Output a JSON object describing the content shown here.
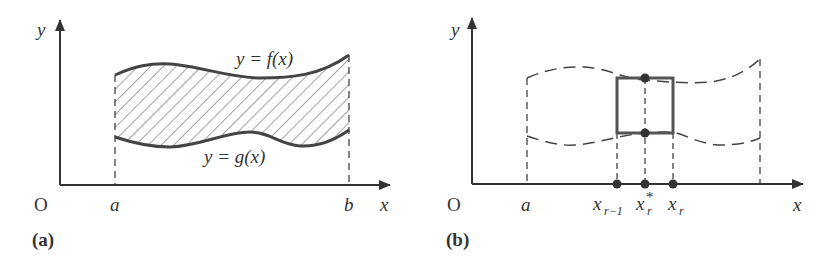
{
  "colors": {
    "ink": "#333333",
    "curve": "#444444",
    "background": "#ffffff"
  },
  "panel_a": {
    "caption": "(a)",
    "origin_label": "O",
    "x_axis_label": "x",
    "y_axis_label": "y",
    "a_label": "a",
    "b_label": "b",
    "upper_curve_label": "y = f(x)",
    "lower_curve_label": "y = g(x)",
    "region_fill": "hatched"
  },
  "panel_b": {
    "caption": "(b)",
    "origin_label": "O",
    "x_axis_label": "x",
    "y_axis_label": "y",
    "a_label": "a",
    "x_r_minus_1_label": "x",
    "x_r_minus_1_sub": "r−1",
    "x_r_star_label": "x",
    "x_r_star_sub": "r",
    "x_r_star_sup": "*",
    "x_r_label": "x",
    "x_r_sub": "r",
    "strip": "rectangle of width x_r − x_{r−1}, height f(x_r*) − g(x_r*)"
  }
}
